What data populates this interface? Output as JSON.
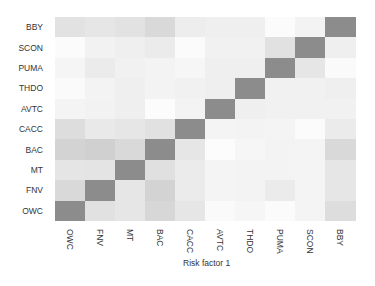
{
  "chart_data": {
    "type": "heatmap",
    "title": "",
    "xlabel": "Risk factor 1",
    "ylabel": "",
    "x_categories": [
      "OWC",
      "FNV",
      "MT",
      "BAC",
      "CACC",
      "AVTC",
      "THDO",
      "PUMA",
      "SCON",
      "BBY"
    ],
    "y_categories_top_to_bottom": [
      "BBY",
      "SCON",
      "PUMA",
      "THDO",
      "AVTC",
      "CACC",
      "BAC",
      "MT",
      "FNV",
      "OWC"
    ],
    "colormap": "greys",
    "value_note": "approximate relative intensity 0 (white) to 1 (diagonal dark gray)",
    "rows": [
      {
        "label": "BBY",
        "values": [
          0.24,
          0.2,
          0.24,
          0.32,
          0.14,
          0.12,
          0.12,
          0.02,
          0.09,
          1.0
        ]
      },
      {
        "label": "SCON",
        "values": [
          0.02,
          0.1,
          0.12,
          0.16,
          0.02,
          0.11,
          0.11,
          0.25,
          1.0,
          0.12
        ]
      },
      {
        "label": "PUMA",
        "values": [
          0.07,
          0.16,
          0.11,
          0.09,
          0.06,
          0.12,
          0.12,
          1.0,
          0.2,
          0.03
        ]
      },
      {
        "label": "THDO",
        "values": [
          0.03,
          0.09,
          0.12,
          0.09,
          0.11,
          0.12,
          1.0,
          0.11,
          0.11,
          0.12
        ]
      },
      {
        "label": "AVTC",
        "values": [
          0.08,
          0.1,
          0.12,
          0.01,
          0.09,
          1.0,
          0.12,
          0.11,
          0.11,
          0.11
        ]
      },
      {
        "label": "CACC",
        "values": [
          0.28,
          0.18,
          0.2,
          0.25,
          1.0,
          0.08,
          0.09,
          0.08,
          0.02,
          0.16
        ]
      },
      {
        "label": "BAC",
        "values": [
          0.37,
          0.4,
          0.32,
          1.0,
          0.2,
          0.01,
          0.06,
          0.09,
          0.08,
          0.32
        ]
      },
      {
        "label": "MT",
        "values": [
          0.21,
          0.22,
          1.0,
          0.26,
          0.16,
          0.08,
          0.09,
          0.09,
          0.08,
          0.2
        ]
      },
      {
        "label": "FNV",
        "values": [
          0.32,
          1.0,
          0.2,
          0.37,
          0.16,
          0.08,
          0.09,
          0.16,
          0.08,
          0.2
        ]
      },
      {
        "label": "OWC",
        "values": [
          1.0,
          0.25,
          0.2,
          0.34,
          0.2,
          0.03,
          0.06,
          0.02,
          0.08,
          0.28
        ]
      }
    ],
    "grid": false,
    "legend": "none",
    "diagonal_color": "#8c8c8c"
  }
}
